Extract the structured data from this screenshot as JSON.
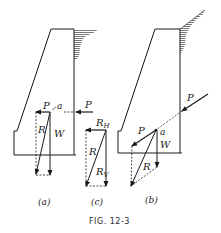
{
  "figure": {
    "caption": "FIG. 12-3",
    "colors": {
      "ink": "#1a1a1a",
      "hatch": "#555555",
      "background": "#ffffff"
    }
  },
  "panels": {
    "a": {
      "label": "(a)",
      "force_external": "P",
      "force_component_P": "P",
      "point": "a",
      "resultant": "R",
      "weight": "W"
    },
    "c": {
      "label": "(c)",
      "horizontal_component": "R",
      "horizontal_sub": "H",
      "resultant": "R",
      "vertical_component": "R",
      "vertical_sub": "V"
    },
    "b": {
      "label": "(b)",
      "force_external": "P",
      "force_component_P": "P",
      "point": "a",
      "resultant": "R",
      "weight": "W"
    }
  }
}
